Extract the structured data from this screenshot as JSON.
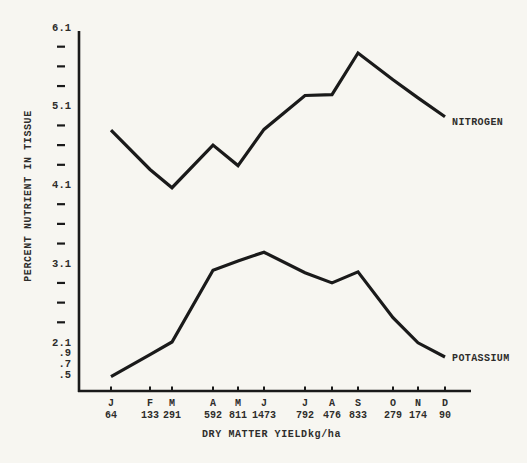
{
  "figure": {
    "background": "#f7f6f1",
    "ink": "#1a1a1a",
    "text_color": "#2e2d2b"
  },
  "chart_data": {
    "type": "line",
    "title": "",
    "ylabel": "PERCENT NUTRIENT IN TISSUE",
    "xlabel": "DRY MATTER YIELD",
    "xlabel_unit": "kg/ha",
    "categories": [
      "J",
      "F",
      "M",
      "A",
      "M",
      "J",
      "J",
      "A",
      "S",
      "O",
      "N",
      "D"
    ],
    "dry_matter_yield_kg_ha": [
      "64",
      "133",
      "291",
      "592",
      "811",
      "1473",
      "792",
      "476",
      "833",
      "279",
      "174",
      "90"
    ],
    "y_axis": {
      "major_tick_labels": [
        "6.1",
        "5.1",
        "4.1",
        "3.1",
        "2.1"
      ],
      "major_tick_values": [
        6.1,
        5.1,
        4.1,
        3.1,
        2.1
      ],
      "minor_ticks_between_majors": 3,
      "sub_labels": [
        ".9",
        ".7",
        ".5"
      ],
      "range_shown": [
        1.5,
        6.1
      ]
    },
    "series": [
      {
        "name": "NITROGEN",
        "values": [
          4.79,
          4.29,
          4.06,
          4.6,
          4.34,
          4.8,
          5.23,
          5.24,
          5.77,
          5.43,
          5.2,
          4.96
        ]
      },
      {
        "name": "POTASSIUM",
        "values": [
          1.66,
          1.94,
          2.1,
          3.01,
          3.13,
          3.24,
          2.98,
          2.85,
          2.99,
          2.41,
          2.09,
          1.91
        ]
      }
    ],
    "grid": false,
    "legend_position": "labels at right end of each line"
  }
}
